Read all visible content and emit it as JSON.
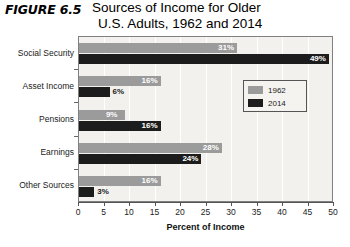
{
  "figure": {
    "number_label": "FIGURE 6.5",
    "title_line1": "Sources of Income for Older",
    "title_line2": "U.S. Adults, 1962 and 2014"
  },
  "legend": {
    "entries": [
      {
        "label": "1962",
        "color": "#9b9b9b"
      },
      {
        "label": "2014",
        "color": "#1c1c1c"
      }
    ]
  },
  "axis": {
    "x_title": "Percent of Income",
    "x_ticks": [
      "0",
      "5",
      "10",
      "15",
      "20",
      "25",
      "30",
      "35",
      "40",
      "45",
      "50"
    ]
  },
  "chart_data": {
    "type": "bar",
    "orientation": "horizontal",
    "title": "Sources of Income for Older U.S. Adults, 1962 and 2014",
    "xlabel": "Percent of Income",
    "ylabel": "",
    "xlim": [
      0,
      50
    ],
    "xticks": [
      0,
      5,
      10,
      15,
      20,
      25,
      30,
      35,
      40,
      45,
      50
    ],
    "grid": true,
    "legend_position": "inside-upper-right",
    "categories": [
      "Social Security",
      "Asset Income",
      "Pensions",
      "Earnings",
      "Other Sources"
    ],
    "series": [
      {
        "name": "1962",
        "color": "#9b9b9b",
        "values": [
          31,
          16,
          9,
          28,
          16
        ],
        "value_labels": [
          "31%",
          "16%",
          "9%",
          "28%",
          "16%"
        ]
      },
      {
        "name": "2014",
        "color": "#1c1c1c",
        "values": [
          49,
          6,
          16,
          24,
          3
        ],
        "value_labels": [
          "49%",
          "6%",
          "16%",
          "24%",
          "3%"
        ]
      }
    ]
  }
}
